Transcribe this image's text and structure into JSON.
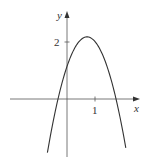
{
  "chart_data": {
    "type": "line",
    "title": "",
    "xlabel": "x",
    "ylabel": "y",
    "x_ticks": [
      {
        "value": 1,
        "label": "1"
      }
    ],
    "y_ticks": [
      {
        "value": 2,
        "label": "2"
      }
    ],
    "grid": false,
    "legend": null,
    "series": [
      {
        "name": "parabola",
        "description": "downward-opening parabola, vertex near (0.72, 2.18), x-intercepts near -0.32 and 1.75, y-intercept near 1.1",
        "equation_approx": "y = -2.03(x - 0.715)^2 + 2.18",
        "x": [
          -0.7,
          -0.32,
          0,
          0.5,
          0.715,
          1,
          1.5,
          1.75,
          2.1
        ],
        "y": [
          -1.88,
          0.0,
          1.14,
          2.09,
          2.18,
          2.02,
          0.93,
          0.0,
          -1.72
        ]
      }
    ],
    "axis_ranges": {
      "x": [
        -2.3,
        2.6
      ],
      "y": [
        -2.0,
        3.1
      ]
    },
    "color": "#333333"
  },
  "labels": {
    "x_axis": "x",
    "y_axis": "y",
    "tick_x1": "1",
    "tick_y2": "2"
  }
}
